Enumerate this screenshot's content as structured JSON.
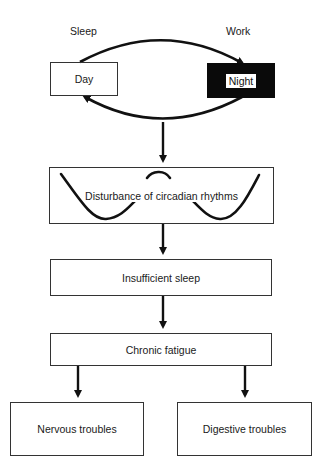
{
  "diagram": {
    "cycle": {
      "left_label": "Sleep",
      "right_label": "Work",
      "left_box": "Day",
      "right_box": "Night"
    },
    "steps": [
      {
        "id": "circadian",
        "label": "Disturbance of circadian rhythms"
      },
      {
        "id": "insufficient-sleep",
        "label": "Insufficient sleep"
      },
      {
        "id": "chronic-fatigue",
        "label": "Chronic fatigue"
      }
    ],
    "outcomes": [
      {
        "id": "nervous",
        "label": "Nervous troubles"
      },
      {
        "id": "digestive",
        "label": "Digestive troubles"
      }
    ],
    "colors": {
      "line": "#111111",
      "box_border": "#333333",
      "night_fill": "#0a0a0a"
    }
  }
}
